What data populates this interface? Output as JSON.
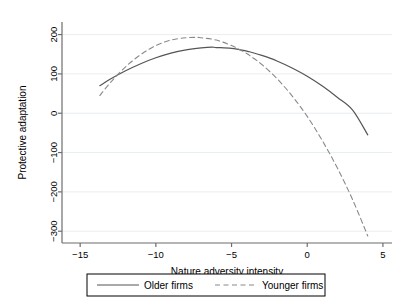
{
  "chart_data": {
    "type": "line",
    "title": "",
    "xlabel": "Nature adversity intensity",
    "ylabel": "Protective adaptation",
    "xlim": [
      -16.2,
      5.6
    ],
    "ylim": [
      -330,
      232
    ],
    "xticks": [
      -15,
      -10,
      -5,
      0,
      5
    ],
    "xtick_labels": [
      "−15",
      "−10",
      "−5",
      "0",
      "5"
    ],
    "yticks": [
      200,
      100,
      0,
      -100,
      -200,
      -300
    ],
    "ytick_labels": [
      "200",
      "100",
      "0",
      "−100",
      "−200",
      "−300"
    ],
    "grid": "horizontal",
    "grid_color": "#e8eef2",
    "legend_position": "below-bottom-center",
    "axis_color": "#6d6d6d",
    "series": [
      {
        "name": "Older firms",
        "style": "solid",
        "color": "#555555",
        "x": [
          -13.7,
          -13.0,
          -12.0,
          -11.0,
          -10.0,
          -9.0,
          -8.0,
          -7.0,
          -6.3,
          -6.0,
          -5.0,
          -4.0,
          -3.7,
          -3.0,
          -2.0,
          -1.0,
          0.0,
          1.0,
          2.0,
          3.0,
          4.0
        ],
        "y": [
          70,
          87,
          108,
          126,
          141,
          153,
          161,
          166,
          168,
          167,
          165,
          158,
          155,
          147,
          133,
          115,
          94,
          69,
          40,
          8,
          -55
        ]
      },
      {
        "name": "Younger firms",
        "style": "dashed",
        "color": "#8a8a8a",
        "x": [
          -13.7,
          -13.0,
          -12.0,
          -11.0,
          -10.0,
          -9.0,
          -8.0,
          -7.3,
          -7.0,
          -6.0,
          -5.0,
          -4.0,
          -3.7,
          -3.0,
          -2.0,
          -1.0,
          0.0,
          1.0,
          2.0,
          3.0,
          4.0
        ],
        "y": [
          45,
          78,
          118,
          149,
          172,
          186,
          192,
          193,
          192,
          186,
          172,
          152,
          144,
          124,
          88,
          44,
          -8,
          -70,
          -140,
          -220,
          -312
        ]
      }
    ]
  },
  "legend": {
    "items": [
      {
        "label": "Older firms",
        "style": "solid"
      },
      {
        "label": "Younger firms",
        "style": "dashed"
      }
    ]
  }
}
